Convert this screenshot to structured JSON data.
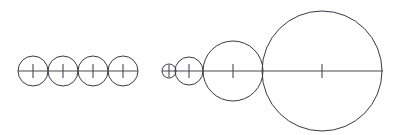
{
  "figure": {
    "background_color": "#fefefe",
    "stroke_color": "#3a3a42",
    "axis_color": "#4a4a50",
    "width": 395,
    "height": 135,
    "baseline_y": 71
  },
  "groups": [
    {
      "name": "equal-circles-group",
      "label": "Equal tangent circles",
      "axis": {
        "x1": 18,
        "x2": 138,
        "y": 71,
        "stroke_width": 1
      },
      "circles": [
        {
          "label": "circle-1",
          "cx": 33,
          "cy": 71,
          "r": 15,
          "stroke_width": 1
        },
        {
          "label": "circle-2",
          "cx": 63,
          "cy": 71,
          "r": 15,
          "stroke_width": 1
        },
        {
          "label": "circle-3",
          "cx": 93,
          "cy": 71,
          "r": 15,
          "stroke_width": 1
        },
        {
          "label": "circle-4",
          "cx": 123,
          "cy": 71,
          "r": 15,
          "stroke_width": 1
        }
      ],
      "ticks": [
        {
          "label": "tick-1",
          "x": 33,
          "y1": 64,
          "y2": 78,
          "stroke_width": 1
        },
        {
          "label": "tick-2",
          "x": 63,
          "y1": 64,
          "y2": 78,
          "stroke_width": 1
        },
        {
          "label": "tick-3",
          "x": 93,
          "y1": 64,
          "y2": 78,
          "stroke_width": 1
        },
        {
          "label": "tick-4",
          "x": 123,
          "y1": 64,
          "y2": 78,
          "stroke_width": 1
        }
      ]
    },
    {
      "name": "doubling-circles-group",
      "label": "Geometrically growing tangent circles",
      "axis": {
        "x1": 162,
        "x2": 383,
        "y": 71,
        "stroke_width": 1
      },
      "circles": [
        {
          "label": "circle-1",
          "cx": 169,
          "cy": 71,
          "r": 7,
          "stroke_width": 1
        },
        {
          "label": "circle-2",
          "cx": 189,
          "cy": 71,
          "r": 14,
          "stroke_width": 1
        },
        {
          "label": "circle-3",
          "cx": 233,
          "cy": 71,
          "r": 30,
          "stroke_width": 1
        },
        {
          "label": "circle-4",
          "cx": 322,
          "cy": 71,
          "r": 60,
          "stroke_width": 1
        }
      ],
      "ticks": [
        {
          "label": "tick-1",
          "x": 169,
          "y1": 65,
          "y2": 77,
          "stroke_width": 1
        },
        {
          "label": "tick-2",
          "x": 189,
          "y1": 64,
          "y2": 78,
          "stroke_width": 1
        },
        {
          "label": "tick-3",
          "x": 233,
          "y1": 64,
          "y2": 78,
          "stroke_width": 1
        },
        {
          "label": "tick-4",
          "x": 322,
          "y1": 64,
          "y2": 78,
          "stroke_width": 1
        }
      ]
    }
  ]
}
